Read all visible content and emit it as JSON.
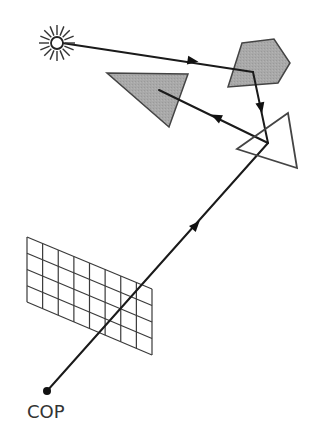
{
  "diagram": {
    "labels": {
      "cop": "COP"
    },
    "colors": {
      "stroke": "#2a2a2a",
      "ray": "#1a1a1a",
      "shaded_fill": "#a9a9a9",
      "outline_fill": "#ffffff",
      "grid": "#3a3a3a",
      "background": "#ffffff"
    },
    "light_source": {
      "icon": "sun-icon",
      "cx": 57,
      "cy": 43,
      "r": 6,
      "ray_outer": 18,
      "ray_count": 16
    },
    "cop_point": {
      "cx": 47,
      "cy": 391,
      "r": 4
    },
    "image_plane_grid": {
      "rows": 4,
      "cols": 8,
      "corners": {
        "tl": [
          27,
          237
        ],
        "bl": [
          27,
          302
        ],
        "tr": [
          152,
          289
        ],
        "br": [
          152,
          355
        ]
      }
    },
    "objects": [
      {
        "name": "pentagon",
        "shaded": true,
        "points": [
          [
            242,
            43
          ],
          [
            274,
            39
          ],
          [
            290,
            63
          ],
          [
            278,
            83
          ],
          [
            228,
            87
          ]
        ]
      },
      {
        "name": "gray-triangle",
        "shaded": true,
        "points": [
          [
            107,
            73
          ],
          [
            188,
            74
          ],
          [
            169,
            127
          ]
        ]
      },
      {
        "name": "outline-triangle",
        "shaded": false,
        "points": [
          [
            288,
            113
          ],
          [
            237,
            149
          ],
          [
            297,
            168
          ]
        ]
      }
    ],
    "rays": [
      {
        "name": "light-to-pentagon",
        "from": [
          62,
          43
        ],
        "to": [
          253,
          72
        ],
        "arrow_at": [
          193,
          61
        ]
      },
      {
        "name": "pentagon-to-triangle",
        "from": [
          253,
          72
        ],
        "to": [
          268,
          143
        ],
        "arrow_at": [
          261,
          108
        ]
      },
      {
        "name": "triangle-to-gray-triangle",
        "from": [
          268,
          143
        ],
        "to": [
          159,
          90
        ],
        "arrow_at": [
          216,
          117
        ]
      },
      {
        "name": "cop-to-triangle",
        "from": [
          47,
          391
        ],
        "to": [
          268,
          143
        ],
        "arrow_at": [
          196,
          225
        ]
      }
    ]
  }
}
